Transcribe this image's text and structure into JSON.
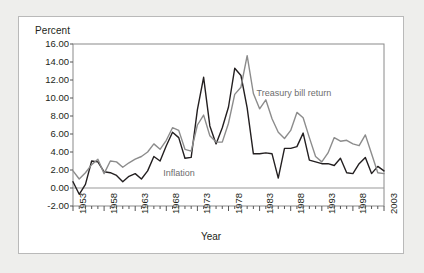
{
  "figure": {
    "background_color": "#eeeeec",
    "panel_color": "#ffffff",
    "panel_border_color": "#b9b9b9"
  },
  "chart_data": {
    "type": "line",
    "title": "",
    "xlabel": "Year",
    "ylabel": "Percent",
    "ylim": [
      -2.0,
      16.0
    ],
    "ytick_step": 2.0,
    "ytick_labels": [
      "16.00",
      "14.00",
      "12.00",
      "10.00",
      "8.00",
      "6.00",
      "4.00",
      "2.00",
      "0.00",
      "-2.00"
    ],
    "ytick_values": [
      16,
      14,
      12,
      10,
      8,
      6,
      4,
      2,
      0,
      -2
    ],
    "xlim": [
      1953,
      2003
    ],
    "xtick_labels": [
      "1953",
      "1958",
      "1963",
      "1968",
      "1973",
      "1978",
      "1983",
      "1988",
      "1993",
      "1998",
      "2003"
    ],
    "xtick_values": [
      1953,
      1958,
      1963,
      1968,
      1973,
      1978,
      1983,
      1988,
      1993,
      1998,
      2003
    ],
    "minor_ticks": true,
    "grid": false,
    "zero_line": true,
    "zero_line_color": "#9a9a9a",
    "legend_position": "inline-annotations",
    "x": [
      1953,
      1954,
      1955,
      1956,
      1957,
      1958,
      1959,
      1960,
      1961,
      1962,
      1963,
      1964,
      1965,
      1966,
      1967,
      1968,
      1969,
      1970,
      1971,
      1972,
      1973,
      1974,
      1975,
      1976,
      1977,
      1978,
      1979,
      1980,
      1981,
      1982,
      1983,
      1984,
      1985,
      1986,
      1987,
      1988,
      1989,
      1990,
      1991,
      1992,
      1993,
      1994,
      1995,
      1996,
      1997,
      1998,
      1999,
      2000,
      2001,
      2002,
      2003
    ],
    "series": [
      {
        "name": "Inflation",
        "color": "#231f20",
        "width": 1.4,
        "label_x": 1967.5,
        "label_y": 1.6,
        "values": [
          0.7,
          -0.7,
          0.4,
          3.0,
          2.9,
          1.8,
          1.7,
          1.4,
          0.7,
          1.3,
          1.6,
          1.0,
          1.9,
          3.5,
          3.0,
          4.7,
          6.2,
          5.6,
          3.3,
          3.4,
          8.7,
          12.3,
          6.9,
          4.9,
          6.7,
          9.0,
          13.3,
          12.5,
          8.9,
          3.8,
          3.8,
          3.9,
          3.8,
          1.1,
          4.4,
          4.4,
          4.6,
          6.1,
          3.1,
          2.9,
          2.7,
          2.7,
          2.5,
          3.3,
          1.7,
          1.6,
          2.7,
          3.4,
          1.6,
          2.4,
          1.9
        ]
      },
      {
        "name": "Treasury bill return",
        "color": "#8c8c8c",
        "width": 1.4,
        "label_x": 1982.5,
        "label_y": 10.4,
        "values": [
          1.9,
          1.0,
          1.7,
          2.6,
          3.2,
          1.6,
          3.0,
          2.9,
          2.3,
          2.8,
          3.2,
          3.5,
          4.0,
          4.9,
          4.3,
          5.3,
          6.7,
          6.4,
          4.3,
          4.1,
          7.0,
          8.1,
          5.8,
          5.1,
          5.1,
          7.2,
          10.4,
          11.2,
          14.7,
          10.5,
          8.8,
          9.8,
          7.7,
          6.2,
          5.5,
          6.4,
          8.4,
          7.8,
          5.6,
          3.5,
          2.9,
          3.9,
          5.6,
          5.2,
          5.3,
          4.9,
          4.7,
          5.9,
          3.8,
          1.7,
          1.6
        ]
      }
    ],
    "annotations": [
      {
        "text": "Inflation",
        "series": "Inflation"
      },
      {
        "text": "Treasury bill return",
        "series": "Treasury bill return"
      }
    ]
  }
}
